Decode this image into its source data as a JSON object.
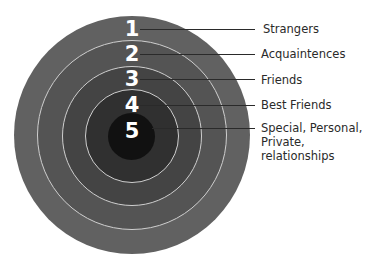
{
  "diagram": {
    "type": "concentric-circles",
    "title": "",
    "rings": [
      {
        "number": "1",
        "label": "Strangers",
        "color": "#616161"
      },
      {
        "number": "2",
        "label": "Acquaintences",
        "color": "#545454"
      },
      {
        "number": "3",
        "label": "Friends",
        "color": "#444444"
      },
      {
        "number": "4",
        "label": "Best Friends",
        "color": "#303030"
      },
      {
        "number": "5",
        "label": "Special, Personal,\nPrivate, relationships",
        "color": "#111111"
      }
    ],
    "ring_border_color": "#cfcfcf",
    "text_color": "#2a2a2a"
  }
}
